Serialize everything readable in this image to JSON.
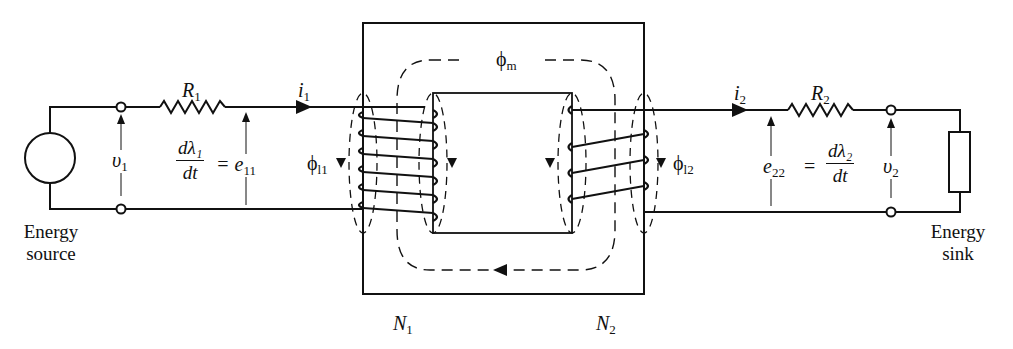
{
  "diagram": {
    "labels": {
      "R1": "R",
      "R1_sub": "1",
      "R2": "R",
      "R2_sub": "2",
      "i1": "i",
      "i1_sub": "1",
      "i2": "i",
      "i2_sub": "2",
      "v1": "υ",
      "v1_sub": "1",
      "v2": "υ",
      "v2_sub": "2",
      "e11": "= e",
      "e11_sub": "11",
      "e22": "e",
      "e22_sub": "22",
      "e22_eq": "=",
      "dl1_num": "dλ₁",
      "dl1_den": "dt",
      "dl2_num": "dλ₂",
      "dl2_den": "dt",
      "phi_m": "ϕ",
      "phi_m_sub": "m",
      "phi_l1": "ϕ",
      "phi_l1_sub": "l1",
      "phi_l2": "ϕ",
      "phi_l2_sub": "l2",
      "N1": "N",
      "N1_sub": "1",
      "N2": "N",
      "N2_sub": "2",
      "source_line1": "Energy",
      "source_line2": "source",
      "sink_line1": "Energy",
      "sink_line2": "sink"
    },
    "colors": {
      "ink": "#111111",
      "background": "#ffffff"
    }
  }
}
